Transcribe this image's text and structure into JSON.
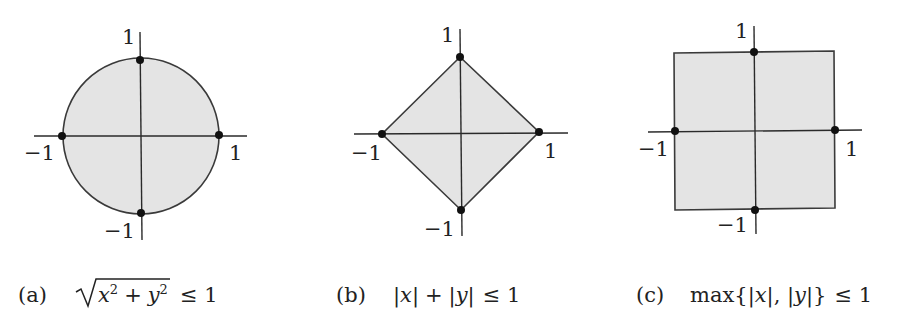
{
  "figure": {
    "panels": [
      {
        "id": "a",
        "shape": "circle",
        "tick_labels": {
          "top": "1",
          "bottom": "−1",
          "left": "−1",
          "right": "1"
        },
        "caption": {
          "label": "(a)",
          "var_x": "x",
          "var_y": "y",
          "exp": "2",
          "plus": "+",
          "relation": "≤ 1"
        }
      },
      {
        "id": "b",
        "shape": "diamond",
        "tick_labels": {
          "top": "1",
          "bottom": "−1",
          "left": "−1",
          "right": "1"
        },
        "caption": {
          "label": "(b)",
          "abs_x": "|x|",
          "plus": "+",
          "abs_y": "|y|",
          "relation": "≤ 1"
        }
      },
      {
        "id": "c",
        "shape": "square",
        "tick_labels": {
          "top": "1",
          "bottom": "−1",
          "left": "−1",
          "right": "1"
        },
        "caption": {
          "label": "(c)",
          "func": "max",
          "open": "{|",
          "x": "x",
          "mid": "|, |",
          "y": "y",
          "close": "|}",
          "relation": "≤ 1"
        }
      }
    ],
    "colors": {
      "fill": "#e4e4e4",
      "stroke": "#3a3a3a",
      "point": "#111111"
    }
  }
}
